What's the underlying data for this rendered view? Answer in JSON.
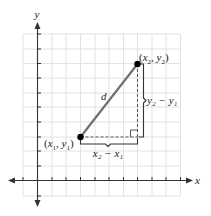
{
  "diagram": {
    "axes": {
      "x_label": "x",
      "y_label": "y"
    },
    "points": {
      "p1": {
        "label": "(x₁, y₁)",
        "label_parts": [
          "(",
          "x",
          "1",
          ", ",
          "y",
          "1",
          ")"
        ]
      },
      "p2": {
        "label": "(x₂, y₂)",
        "label_parts": [
          "(",
          "x",
          "2",
          ", ",
          "y",
          "2",
          ")"
        ]
      }
    },
    "segment_label": "d",
    "horizontal_leg_label": "x₂ − x₁",
    "vertical_leg_label": "y₂ − y₁",
    "colors": {
      "grid": "#e2e2e2",
      "axes": "#333333",
      "segment": "#707070",
      "points": "#000000",
      "legs": "#555555"
    }
  }
}
